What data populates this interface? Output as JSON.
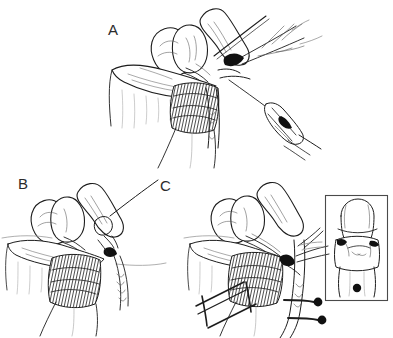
{
  "figure": {
    "style": "pen-and-ink line drawing",
    "background_color": "#ffffff",
    "ink_color": "#1d1d1d",
    "panels": [
      {
        "id": "A",
        "label": "A",
        "label_x": 108,
        "label_y": 22,
        "caption": "Dissection of the structure with an applier instrument and branching ducts/vessels at upper right",
        "elements": [
          "lobed-organ",
          "tissue-flap",
          "shaded-tubular-structure",
          "branching-duct-tree",
          "retracting-probe",
          "clip-applier-instrument"
        ]
      },
      {
        "id": "B",
        "label": "B",
        "label_x": 18,
        "label_y": 176,
        "caption": "Same anatomy after suture placement, with suture tails trailing downward",
        "elements": [
          "lobed-organ",
          "tissue-flap",
          "shaded-tubular-structure",
          "suture-loop",
          "suture-tails",
          "horizon-line"
        ]
      },
      {
        "id": "C",
        "label": "C",
        "label_x": 160,
        "label_y": 178,
        "caption": "Completed repair with ladder-shaped retractor and two round-headed pins placed laterally",
        "elements": [
          "lobed-organ",
          "tissue-flap",
          "shaded-tubular-structure",
          "ladder-retractor",
          "pin-upper",
          "pin-lower",
          "vessel-pair",
          "horizon-line"
        ]
      }
    ],
    "inset": {
      "present": true,
      "label": "",
      "x": 325,
      "y": 195,
      "width": 62,
      "height": 106,
      "border_color": "#4a4a4a",
      "caption": "Boxed anteroposterior view of the repaired structure with a single round marker below"
    },
    "markers": {
      "pin_head_color": "#111111",
      "pin_head_radius": 4,
      "inset_dot_radius": 4
    }
  }
}
